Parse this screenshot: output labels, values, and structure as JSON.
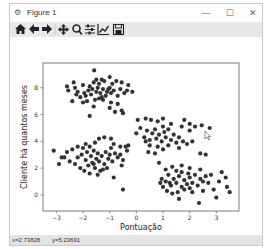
{
  "window": {
    "title": "Figure 1",
    "icon": "matplotlib-figure-icon",
    "controls": {
      "minimize": "—",
      "maximize": "☐",
      "close": "✕"
    }
  },
  "toolbar": {
    "items": [
      {
        "name": "home",
        "icon": "home-icon",
        "glyph": "⌂"
      },
      {
        "name": "back",
        "icon": "arrow-left-icon",
        "glyph": "←"
      },
      {
        "name": "forward",
        "icon": "arrow-right-icon",
        "glyph": "→"
      },
      {
        "name": "pan",
        "icon": "move-icon",
        "glyph": "✥"
      },
      {
        "name": "zoom",
        "icon": "zoom-icon",
        "glyph": "🔍"
      },
      {
        "name": "configure-subplots",
        "icon": "sliders-icon",
        "glyph": "≛"
      },
      {
        "name": "edit-axis",
        "icon": "line-chart-icon",
        "glyph": "📈"
      },
      {
        "name": "save",
        "icon": "save-icon",
        "glyph": "💾"
      }
    ]
  },
  "status": {
    "x": "x=2.73828",
    "y": "y=5.23691"
  },
  "chart_data": {
    "type": "scatter",
    "title": "",
    "xlabel": "Pontuação",
    "ylabel": "Cliente há quantos meses",
    "xlim": [
      -3.5,
      3.85
    ],
    "ylim": [
      -1.2,
      9.85
    ],
    "xticks": [
      -3,
      -2,
      -1,
      0,
      1,
      2,
      3
    ],
    "yticks": [
      0,
      2,
      4,
      6,
      8
    ],
    "grid": false,
    "marker_color": "#333333",
    "series": [
      {
        "name": "cluster-top-left",
        "points": [
          [
            -1.58,
            9.3
          ],
          [
            -1.0,
            8.8
          ],
          [
            -1.3,
            8.6
          ],
          [
            -2.35,
            8.4
          ],
          [
            -2.3,
            8.0
          ],
          [
            -2.0,
            8.2
          ],
          [
            -1.75,
            8.1
          ],
          [
            -1.6,
            8.4
          ],
          [
            -1.4,
            8.3
          ],
          [
            -1.2,
            8.5
          ],
          [
            -0.9,
            8.3
          ],
          [
            -0.75,
            8.5
          ],
          [
            -0.55,
            8.4
          ],
          [
            -0.3,
            8.2
          ],
          [
            -2.6,
            8.1
          ],
          [
            -2.55,
            7.8
          ],
          [
            -2.25,
            7.5
          ],
          [
            -2.1,
            7.3
          ],
          [
            -1.95,
            7.6
          ],
          [
            -1.8,
            7.8
          ],
          [
            -1.7,
            7.5
          ],
          [
            -1.65,
            7.9
          ],
          [
            -1.5,
            7.7
          ],
          [
            -1.45,
            8.0
          ],
          [
            -1.35,
            7.6
          ],
          [
            -1.25,
            7.9
          ],
          [
            -1.15,
            7.4
          ],
          [
            -1.1,
            7.7
          ],
          [
            -1.0,
            8.0
          ],
          [
            -0.95,
            7.6
          ],
          [
            -0.85,
            7.8
          ],
          [
            -0.7,
            7.4
          ],
          [
            -0.6,
            7.9
          ],
          [
            -0.45,
            7.6
          ],
          [
            -0.35,
            7.8
          ],
          [
            -0.15,
            7.7
          ],
          [
            -2.0,
            6.9
          ],
          [
            -1.85,
            7.0
          ],
          [
            -1.55,
            7.1
          ],
          [
            -1.4,
            7.2
          ],
          [
            -1.25,
            7.1
          ],
          [
            -0.95,
            6.9
          ],
          [
            -0.7,
            6.8
          ],
          [
            -2.4,
            7.0
          ],
          [
            -1.6,
            6.6
          ],
          [
            -1.0,
            6.5
          ],
          [
            -0.8,
            6.2
          ],
          [
            -0.55,
            6.3
          ],
          [
            -1.75,
            5.9
          ],
          [
            -0.5,
            6.1
          ],
          [
            -1.9,
            7.4
          ],
          [
            -1.3,
            7.3
          ],
          [
            -1.05,
            7.9
          ],
          [
            -1.5,
            8.6
          ],
          [
            -2.2,
            7.7
          ]
        ]
      },
      {
        "name": "cluster-bottom-left",
        "points": [
          [
            -3.1,
            3.3
          ],
          [
            -2.8,
            2.8
          ],
          [
            -2.6,
            3.2
          ],
          [
            -2.4,
            3.4
          ],
          [
            -2.2,
            3.6
          ],
          [
            -2.0,
            3.5
          ],
          [
            -1.9,
            3.8
          ],
          [
            -1.75,
            3.6
          ],
          [
            -1.55,
            3.9
          ],
          [
            -1.4,
            4.2
          ],
          [
            -1.2,
            4.3
          ],
          [
            -0.95,
            4.2
          ],
          [
            -0.85,
            3.8
          ],
          [
            -0.6,
            3.6
          ],
          [
            -2.9,
            2.3
          ],
          [
            -2.5,
            2.5
          ],
          [
            -2.2,
            2.8
          ],
          [
            -2.05,
            3.0
          ],
          [
            -1.9,
            2.6
          ],
          [
            -1.85,
            3.2
          ],
          [
            -1.8,
            2.2
          ],
          [
            -1.7,
            2.9
          ],
          [
            -1.65,
            2.4
          ],
          [
            -1.6,
            3.3
          ],
          [
            -1.55,
            2.0
          ],
          [
            -1.5,
            2.7
          ],
          [
            -1.45,
            3.1
          ],
          [
            -1.4,
            2.5
          ],
          [
            -1.35,
            1.8
          ],
          [
            -1.3,
            2.9
          ],
          [
            -1.2,
            2.3
          ],
          [
            -1.15,
            3.2
          ],
          [
            -1.05,
            2.7
          ],
          [
            -1.0,
            3.0
          ],
          [
            -0.95,
            3.5
          ],
          [
            -0.9,
            2.5
          ],
          [
            -0.8,
            3.1
          ],
          [
            -0.7,
            2.8
          ],
          [
            -0.6,
            3.0
          ],
          [
            -0.5,
            2.6
          ],
          [
            -0.35,
            3.3
          ],
          [
            -0.3,
            3.7
          ],
          [
            -2.1,
            2.0
          ],
          [
            -1.75,
            1.6
          ],
          [
            -1.45,
            1.5
          ],
          [
            -1.1,
            2.0
          ],
          [
            -0.85,
            1.3
          ],
          [
            -0.55,
            2.2
          ],
          [
            -2.3,
            2.3
          ],
          [
            -1.95,
            1.8
          ],
          [
            -1.25,
            1.9
          ],
          [
            -0.5,
            0.4
          ],
          [
            -0.4,
            3.6
          ],
          [
            -2.7,
            2.8
          ],
          [
            -1.6,
            2.3
          ]
        ]
      },
      {
        "name": "cluster-middle-right",
        "points": [
          [
            0.05,
            5.6
          ],
          [
            0.35,
            5.7
          ],
          [
            0.55,
            5.6
          ],
          [
            0.8,
            5.5
          ],
          [
            1.0,
            5.7
          ],
          [
            1.3,
            5.3
          ],
          [
            1.8,
            5.6
          ],
          [
            2.0,
            5.3
          ],
          [
            2.2,
            5.1
          ],
          [
            2.45,
            5.2
          ],
          [
            2.75,
            5.0
          ],
          [
            1.7,
            5.1
          ],
          [
            2.0,
            4.8
          ],
          [
            0.0,
            4.6
          ],
          [
            0.15,
            5.0
          ],
          [
            0.3,
            4.3
          ],
          [
            0.4,
            4.8
          ],
          [
            0.5,
            4.1
          ],
          [
            0.6,
            4.6
          ],
          [
            0.7,
            4.9
          ],
          [
            0.75,
            4.2
          ],
          [
            0.85,
            4.5
          ],
          [
            0.95,
            4.0
          ],
          [
            1.05,
            4.7
          ],
          [
            1.1,
            4.3
          ],
          [
            1.2,
            4.9
          ],
          [
            1.3,
            4.1
          ],
          [
            1.4,
            4.5
          ],
          [
            1.5,
            3.9
          ],
          [
            1.6,
            4.3
          ],
          [
            1.75,
            4.0
          ],
          [
            1.9,
            3.8
          ],
          [
            2.1,
            4.0
          ],
          [
            0.5,
            3.7
          ],
          [
            0.8,
            3.6
          ],
          [
            1.0,
            3.4
          ],
          [
            1.2,
            3.7
          ],
          [
            0.45,
            3.2
          ],
          [
            0.7,
            3.1
          ],
          [
            1.6,
            3.5
          ],
          [
            2.4,
            3.1
          ],
          [
            2.6,
            3.0
          ],
          [
            0.35,
            4.0
          ],
          [
            1.0,
            5.1
          ]
        ]
      },
      {
        "name": "cluster-bottom-right",
        "points": [
          [
            0.85,
            2.4
          ],
          [
            1.1,
            1.9
          ],
          [
            1.35,
            2.1
          ],
          [
            1.5,
            1.8
          ],
          [
            1.7,
            2.2
          ],
          [
            2.0,
            2.0
          ],
          [
            2.4,
            1.9
          ],
          [
            3.2,
            1.7
          ],
          [
            3.35,
            1.3
          ],
          [
            0.95,
            1.2
          ],
          [
            1.1,
            1.0
          ],
          [
            1.2,
            1.5
          ],
          [
            1.3,
            0.7
          ],
          [
            1.4,
            1.2
          ],
          [
            1.5,
            0.9
          ],
          [
            1.6,
            1.4
          ],
          [
            1.7,
            0.6
          ],
          [
            1.8,
            1.1
          ],
          [
            1.9,
            0.8
          ],
          [
            2.0,
            1.3
          ],
          [
            2.1,
            0.9
          ],
          [
            2.2,
            1.5
          ],
          [
            2.3,
            0.7
          ],
          [
            2.4,
            1.2
          ],
          [
            2.5,
            1.0
          ],
          [
            2.6,
            1.4
          ],
          [
            2.7,
            0.9
          ],
          [
            1.15,
            0.3
          ],
          [
            1.35,
            0.1
          ],
          [
            1.55,
            0.2
          ],
          [
            1.8,
            0.4
          ],
          [
            2.1,
            0.2
          ],
          [
            2.5,
            0.3
          ],
          [
            1.0,
            0.6
          ],
          [
            1.6,
            -0.3
          ],
          [
            2.35,
            -0.6
          ],
          [
            3.0,
            -0.2
          ],
          [
            3.1,
            1.0
          ],
          [
            3.4,
            0.6
          ],
          [
            2.8,
            1.5
          ],
          [
            2.0,
            0.5
          ],
          [
            1.25,
            0.9
          ],
          [
            1.95,
            1.6
          ],
          [
            2.9,
            0.4
          ],
          [
            3.5,
            0.2
          ],
          [
            1.7,
            1.7
          ],
          [
            0.9,
            0.9
          ]
        ]
      }
    ]
  }
}
